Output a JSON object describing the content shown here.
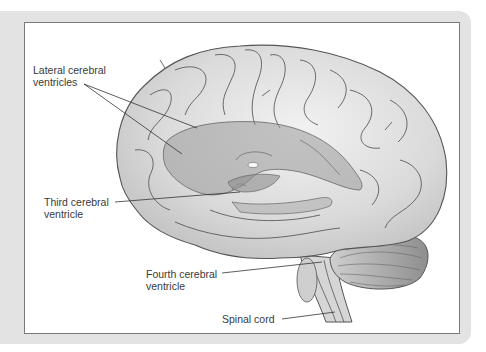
{
  "figure": {
    "labels": [
      {
        "id": "lateral",
        "line1": "Lateral cerebral",
        "line2": "ventricles"
      },
      {
        "id": "third",
        "line1": "Third cerebral",
        "line2": "ventricle"
      },
      {
        "id": "fourth",
        "line1": "Fourth cerebral",
        "line2": "ventricle"
      },
      {
        "id": "spinal",
        "line1": "Spinal cord",
        "line2": ""
      }
    ]
  },
  "colors": {
    "frame": "#e3e3e3",
    "panel_border": "#7a7a7a",
    "brain_fill": "#d9d9d9",
    "brain_stroke": "#555555",
    "ventricle_fill": "#b5b5b5",
    "label_text": "#3a3a3a"
  }
}
